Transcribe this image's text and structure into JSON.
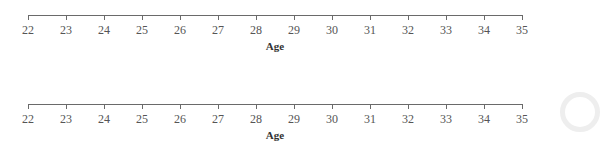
{
  "chart_data": [
    {
      "type": "number-line",
      "title": "",
      "xlabel": "Age",
      "ylabel": "",
      "xlim": [
        22,
        35
      ],
      "ticks": [
        22,
        23,
        24,
        25,
        26,
        27,
        28,
        29,
        30,
        31,
        32,
        33,
        34,
        35
      ],
      "tick_labels": [
        "22",
        "23",
        "24",
        "25",
        "26",
        "27",
        "28",
        "29",
        "30",
        "31",
        "32",
        "33",
        "34",
        "35"
      ],
      "series": [],
      "grid": false
    },
    {
      "type": "number-line",
      "title": "",
      "xlabel": "Age",
      "ylabel": "",
      "xlim": [
        22,
        35
      ],
      "ticks": [
        22,
        23,
        24,
        25,
        26,
        27,
        28,
        29,
        30,
        31,
        32,
        33,
        34,
        35
      ],
      "tick_labels": [
        "22",
        "23",
        "24",
        "25",
        "26",
        "27",
        "28",
        "29",
        "30",
        "31",
        "32",
        "33",
        "34",
        "35"
      ],
      "series": [],
      "grid": false
    }
  ],
  "axes": [
    {
      "title": "Age",
      "labels": [
        "22",
        "23",
        "24",
        "25",
        "26",
        "27",
        "28",
        "29",
        "30",
        "31",
        "32",
        "33",
        "34",
        "35"
      ]
    },
    {
      "title": "Age",
      "labels": [
        "22",
        "23",
        "24",
        "25",
        "26",
        "27",
        "28",
        "29",
        "30",
        "31",
        "32",
        "33",
        "34",
        "35"
      ]
    }
  ]
}
